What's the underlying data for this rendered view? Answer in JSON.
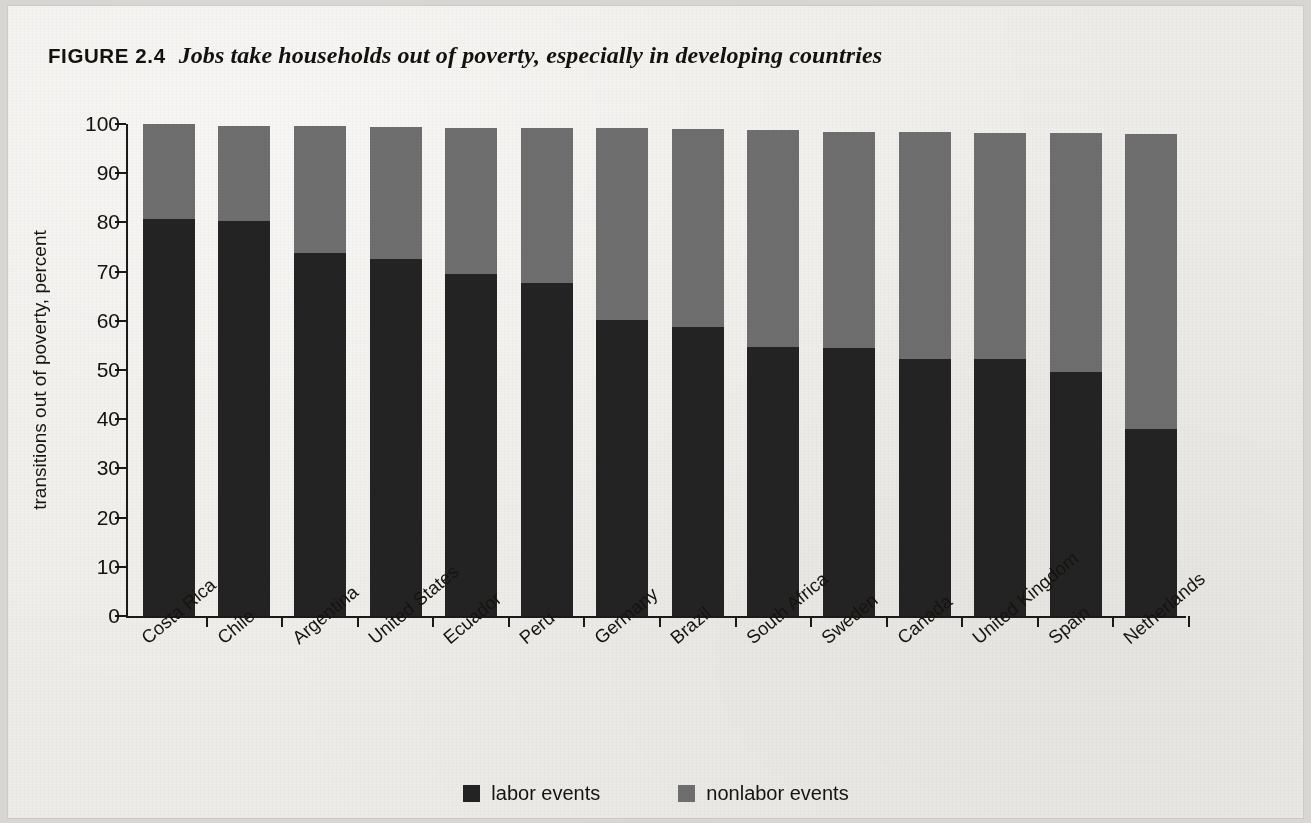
{
  "figure": {
    "number_label": "FIGURE 2.4",
    "caption": "Jobs take households out of poverty, especially in developing countries"
  },
  "colors": {
    "labor": "#232323",
    "nonlabor": "#6e6e6e",
    "paper": "#eeece8",
    "ink": "#16140f"
  },
  "legend": {
    "position": "bottom-center",
    "items": [
      {
        "label": "labor events",
        "color": "#232323",
        "swatch": "square-swatch"
      },
      {
        "label": "nonlabor events",
        "color": "#6e6e6e",
        "swatch": "square-swatch"
      }
    ]
  },
  "chart_data": {
    "type": "bar",
    "subtype": "stacked",
    "title": "Jobs take households out of poverty, especially in developing countries",
    "xlabel": "",
    "ylabel": "transitions out of poverty, percent",
    "ylim": [
      0,
      100
    ],
    "yticks": [
      0,
      10,
      20,
      30,
      40,
      50,
      60,
      70,
      80,
      90,
      100
    ],
    "ytick_labels": [
      "0",
      "10",
      "20",
      "30",
      "40",
      "50",
      "60",
      "70",
      "80",
      "90",
      "100"
    ],
    "grid": false,
    "categories": [
      "Costa Rica",
      "Chile",
      "Argentina",
      "United States",
      "Ecuador",
      "Peru",
      "Germany",
      "Brazil",
      "South Africa",
      "Sweden",
      "Canada",
      "United Kingdom",
      "Spain",
      "Netherlands"
    ],
    "series": [
      {
        "name": "labor events",
        "color": "#232323",
        "values": [
          80.6,
          80.3,
          73.7,
          72.5,
          69.6,
          67.7,
          60.1,
          58.7,
          54.7,
          54.4,
          52.3,
          52.3,
          49.6,
          38.0
        ]
      },
      {
        "name": "nonlabor events",
        "color": "#6e6e6e",
        "values": [
          19.4,
          19.4,
          26.0,
          26.8,
          29.6,
          31.5,
          39.0,
          40.3,
          44.0,
          44.0,
          46.0,
          45.9,
          48.6,
          59.9
        ]
      }
    ],
    "totals": [
      100.0,
      99.7,
      99.7,
      99.3,
      99.2,
      99.2,
      99.1,
      99.0,
      98.7,
      98.4,
      98.3,
      98.2,
      98.2,
      97.9
    ]
  }
}
